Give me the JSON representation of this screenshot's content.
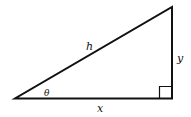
{
  "diagram": {
    "type": "right-triangle",
    "labels": {
      "hypotenuse": "h",
      "opposite": "y",
      "adjacent": "x",
      "angle": "θ"
    },
    "stroke_color": "#111111"
  }
}
